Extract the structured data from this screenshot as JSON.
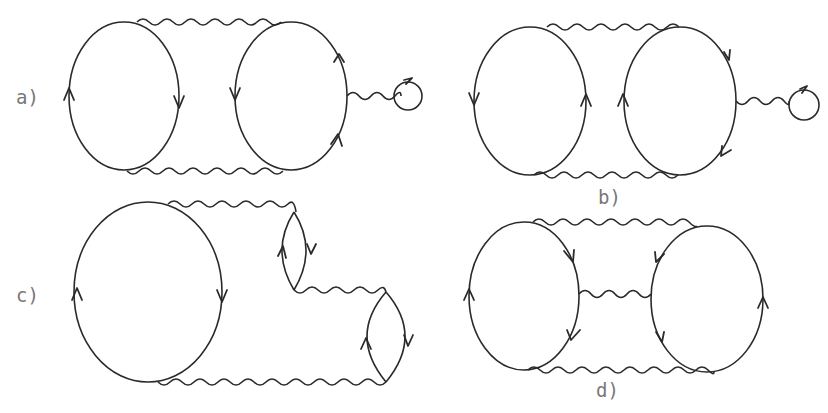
{
  "diagram": {
    "type": "feynman-diagrams",
    "colors": {
      "ink": "#2a2a2a",
      "label": "#777777",
      "background": "#ffffff"
    },
    "panels": [
      {
        "id": "a",
        "label": "a)",
        "fermion_loops": 3,
        "photon_lines": 3,
        "description": "Two large fermion loops joined by two photon lines (top and bottom); right loop attached by photon to small tadpole loop"
      },
      {
        "id": "b",
        "label": "b)",
        "fermion_loops": 3,
        "photon_lines": 3,
        "description": "Two large fermion loops joined by two photon lines with opposite orientation; right loop attached by photon to small tadpole loop"
      },
      {
        "id": "c",
        "label": "c)",
        "fermion_loops": 3,
        "photon_lines": 3,
        "description": "Large fermion loop connected by photon lines through a chain of two small lens-shaped fermion loops"
      },
      {
        "id": "d",
        "label": "d)",
        "fermion_loops": 2,
        "photon_lines": 3,
        "description": "Two large fermion loops joined by three photon lines (top, middle, bottom)"
      }
    ]
  }
}
